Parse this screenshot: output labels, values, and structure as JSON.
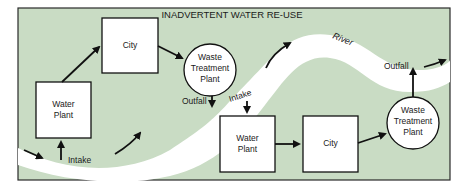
{
  "title": "INADVERTENT WATER RE-USE",
  "colors": {
    "panel": "#c9dcc4",
    "river": "#ffffff",
    "border": "#2a2a2a",
    "box_fill": "#ffffff",
    "stroke": "#111111"
  },
  "labels": {
    "river": "River",
    "intake_1": "Intake",
    "outfall_1": "Outfall",
    "intake_2": "Intake",
    "outfall_2": "Outfall"
  },
  "nodes": {
    "water_plant_1": {
      "line1": "Water",
      "line2": "Plant"
    },
    "city_1": {
      "line1": "City"
    },
    "waste_treatment_1": {
      "line1": "Waste",
      "line2": "Treatment",
      "line3": "Plant"
    },
    "water_plant_2": {
      "line1": "Water",
      "line2": "Plant"
    },
    "city_2": {
      "line1": "City"
    },
    "waste_treatment_2": {
      "line1": "Waste",
      "line2": "Treatment",
      "line3": "Plant"
    }
  }
}
